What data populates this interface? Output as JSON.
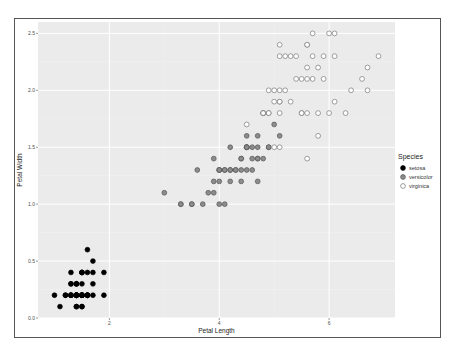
{
  "chart_data": {
    "type": "scatter",
    "title": "",
    "xlabel": "Petal Length",
    "ylabel": "Petal Width",
    "xlim": [
      0.7,
      7.2
    ],
    "ylim": [
      0.0,
      2.6
    ],
    "x_ticks": [
      2,
      4,
      6
    ],
    "y_ticks": [
      0.0,
      0.5,
      1.0,
      1.5,
      2.0,
      2.5
    ],
    "x_tick_labels": [
      "2",
      "4",
      "6"
    ],
    "y_tick_labels": [
      "0.0",
      "0.5",
      "1.0",
      "1.5",
      "2.0",
      "2.5"
    ],
    "grid": true,
    "legend_position": "right",
    "legend": {
      "title": "Species",
      "entries": [
        {
          "label": "setosa",
          "fill": "#000000",
          "stroke": "#000000"
        },
        {
          "label": "versicolor",
          "fill": "#8c8c8c",
          "stroke": "#555555"
        },
        {
          "label": "virginica",
          "fill": "#ffffff",
          "stroke": "#777777"
        }
      ]
    },
    "series": [
      {
        "name": "setosa",
        "x": [
          1.4,
          1.4,
          1.3,
          1.5,
          1.4,
          1.7,
          1.4,
          1.5,
          1.4,
          1.5,
          1.5,
          1.6,
          1.4,
          1.1,
          1.2,
          1.5,
          1.3,
          1.4,
          1.7,
          1.5,
          1.7,
          1.5,
          1.0,
          1.7,
          1.9,
          1.6,
          1.6,
          1.5,
          1.4,
          1.6,
          1.6,
          1.5,
          1.5,
          1.4,
          1.5,
          1.2,
          1.3,
          1.4,
          1.3,
          1.5,
          1.3,
          1.3,
          1.3,
          1.6,
          1.9,
          1.4,
          1.6,
          1.4,
          1.5,
          1.4
        ],
        "y": [
          0.2,
          0.2,
          0.2,
          0.2,
          0.2,
          0.4,
          0.3,
          0.2,
          0.2,
          0.1,
          0.2,
          0.2,
          0.1,
          0.1,
          0.2,
          0.4,
          0.4,
          0.3,
          0.3,
          0.3,
          0.2,
          0.4,
          0.2,
          0.5,
          0.2,
          0.2,
          0.4,
          0.2,
          0.2,
          0.2,
          0.2,
          0.4,
          0.1,
          0.2,
          0.2,
          0.2,
          0.2,
          0.1,
          0.2,
          0.2,
          0.3,
          0.3,
          0.2,
          0.6,
          0.4,
          0.3,
          0.2,
          0.2,
          0.2,
          0.2
        ]
      },
      {
        "name": "versicolor",
        "x": [
          4.7,
          4.5,
          4.9,
          4.0,
          4.6,
          4.5,
          4.7,
          3.3,
          4.6,
          3.9,
          3.5,
          4.2,
          4.0,
          4.7,
          3.6,
          4.4,
          4.5,
          4.1,
          4.5,
          3.9,
          4.8,
          4.0,
          4.9,
          4.7,
          4.3,
          4.4,
          4.8,
          5.0,
          4.5,
          3.5,
          3.8,
          3.7,
          3.9,
          5.1,
          4.5,
          4.5,
          4.7,
          4.4,
          4.1,
          4.0,
          4.4,
          4.6,
          4.0,
          3.3,
          4.2,
          4.2,
          4.2,
          4.3,
          3.0,
          4.1
        ],
        "y": [
          1.4,
          1.5,
          1.5,
          1.3,
          1.5,
          1.3,
          1.6,
          1.0,
          1.3,
          1.4,
          1.0,
          1.5,
          1.0,
          1.4,
          1.3,
          1.4,
          1.5,
          1.0,
          1.5,
          1.1,
          1.8,
          1.3,
          1.5,
          1.2,
          1.3,
          1.4,
          1.4,
          1.7,
          1.5,
          1.0,
          1.1,
          1.0,
          1.2,
          1.6,
          1.5,
          1.6,
          1.5,
          1.3,
          1.3,
          1.3,
          1.2,
          1.4,
          1.2,
          1.0,
          1.3,
          1.2,
          1.3,
          1.3,
          1.1,
          1.3
        ]
      },
      {
        "name": "virginica",
        "x": [
          6.0,
          5.1,
          5.9,
          5.6,
          5.8,
          6.6,
          4.5,
          6.3,
          5.8,
          6.1,
          5.1,
          5.3,
          5.5,
          5.0,
          5.1,
          5.3,
          5.5,
          6.7,
          6.9,
          5.0,
          5.7,
          4.9,
          6.7,
          4.9,
          5.7,
          6.0,
          4.8,
          4.9,
          5.6,
          5.8,
          6.1,
          6.4,
          5.6,
          5.1,
          5.6,
          6.1,
          5.6,
          5.5,
          4.8,
          5.4,
          5.6,
          5.1,
          5.1,
          5.9,
          5.7,
          5.2,
          5.0,
          5.2,
          5.4,
          5.1
        ],
        "y": [
          2.5,
          1.9,
          2.1,
          1.8,
          2.2,
          2.1,
          1.7,
          1.8,
          1.8,
          2.5,
          2.0,
          1.9,
          2.1,
          2.0,
          2.4,
          2.3,
          1.8,
          2.2,
          2.3,
          1.5,
          2.3,
          2.0,
          2.0,
          1.8,
          2.1,
          1.8,
          1.8,
          1.8,
          2.1,
          1.6,
          1.9,
          2.0,
          2.2,
          1.5,
          1.4,
          2.3,
          2.4,
          1.8,
          1.8,
          2.1,
          2.4,
          2.3,
          1.9,
          2.3,
          2.5,
          2.3,
          1.9,
          2.0,
          2.3,
          1.8
        ]
      }
    ]
  },
  "colors": {
    "panel_bg": "#ebebeb",
    "grid_major": "#ffffff",
    "grid_minor": "#f2f2f2",
    "axis_text": "#4d4d4d"
  }
}
